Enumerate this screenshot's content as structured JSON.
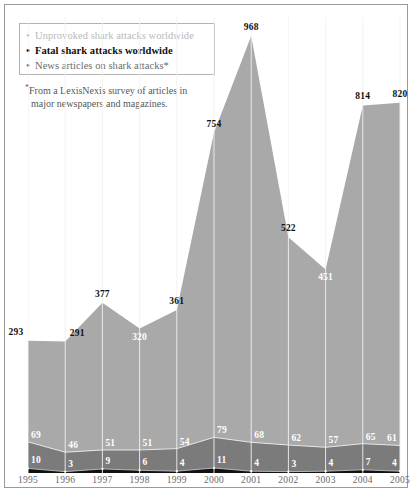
{
  "legend": {
    "items": [
      {
        "label": "Unprovoked shark attacks worldwide",
        "bullet": "•",
        "color": "#b9b9b9",
        "key": "unprovoked"
      },
      {
        "label": "Fatal shark attacks worldwide",
        "bullet": "•",
        "color": "#101010",
        "key": "fatal"
      },
      {
        "label": "News articles on shark attacks*",
        "bullet": "•",
        "color": "#6b6b6b",
        "key": "news"
      }
    ]
  },
  "footnote": {
    "star": "*",
    "line1": "From a LexisNexis survey of articles in",
    "line2": "major newspapers and magazines."
  },
  "chart_data": {
    "type": "area",
    "title": "",
    "subtitle": "",
    "xlabel": "",
    "ylabel": "",
    "grid": true,
    "legend_position": "top-left",
    "categories": [
      "1995",
      "1996",
      "1997",
      "1998",
      "1999",
      "2000",
      "2001",
      "2002",
      "2003",
      "2004",
      "2005"
    ],
    "ylim": [
      0,
      1010
    ],
    "series": [
      {
        "name": "News articles on shark attacks*",
        "key": "news",
        "color": "#a9a9a9",
        "values": [
          293,
          291,
          377,
          320,
          361,
          754,
          968,
          522,
          451,
          814,
          820
        ],
        "label_colors": [
          "dark",
          "dark",
          "dark",
          "white",
          "dark",
          "dark",
          "dark",
          "dark",
          "white",
          "dark",
          "dark"
        ]
      },
      {
        "name": "Unprovoked shark attacks worldwide",
        "key": "unprovoked",
        "color": "#7b7b7b",
        "values": [
          69,
          46,
          51,
          51,
          54,
          79,
          68,
          62,
          57,
          65,
          61
        ],
        "label_colors": [
          "white",
          "white",
          "white",
          "white",
          "white",
          "white",
          "white",
          "white",
          "white",
          "white",
          "white"
        ]
      },
      {
        "name": "Fatal shark attacks worldwide",
        "key": "fatal",
        "color": "#111111",
        "values": [
          10,
          3,
          9,
          6,
          4,
          11,
          4,
          3,
          4,
          7,
          4
        ],
        "label_colors": [
          "white",
          "white",
          "white",
          "white",
          "white",
          "white",
          "white",
          "white",
          "white",
          "white",
          "white"
        ]
      }
    ]
  }
}
